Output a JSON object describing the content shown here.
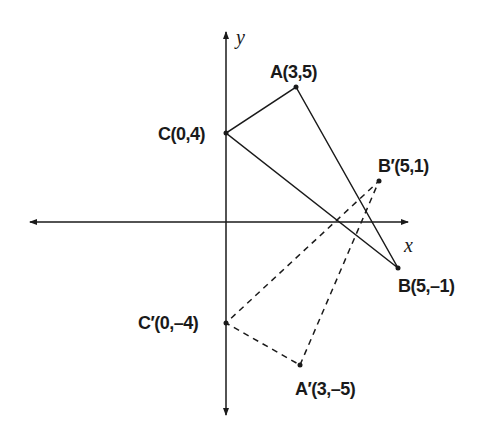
{
  "diagram": {
    "type": "coordinate-plane-reflection",
    "axes": {
      "x_label": "x",
      "y_label": "y"
    },
    "original_triangle": {
      "style": "solid",
      "points": [
        {
          "name": "A",
          "label": "A(3,5)",
          "coords": [
            3,
            5
          ]
        },
        {
          "name": "B",
          "label": "B(5,–1)",
          "coords": [
            5,
            -1
          ]
        },
        {
          "name": "C",
          "label": "C(0,4)",
          "coords": [
            0,
            4
          ]
        }
      ]
    },
    "reflected_triangle": {
      "style": "dashed",
      "points": [
        {
          "name": "A'",
          "label": "A′(3,–5)",
          "coords": [
            3,
            -5
          ]
        },
        {
          "name": "B'",
          "label": "B′(5,1)",
          "coords": [
            5,
            1
          ]
        },
        {
          "name": "C'",
          "label": "C′(0,–4)",
          "coords": [
            0,
            -4
          ]
        }
      ]
    },
    "colors": {
      "line": "#1a1a1a",
      "background": "#ffffff"
    }
  }
}
